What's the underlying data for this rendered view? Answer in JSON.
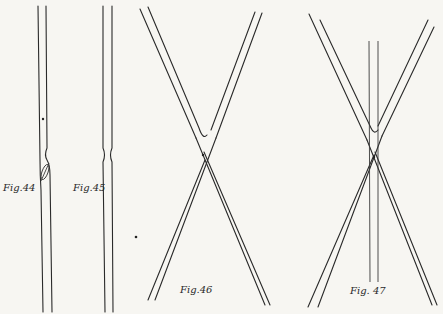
{
  "figures": [
    {
      "id": "fig44",
      "label": "Fig.44",
      "description": "single straight tube with a dot and an oblique oval inclusion near a constriction"
    },
    {
      "id": "fig45",
      "label": "Fig.45",
      "description": "single straight tube with a small constriction"
    },
    {
      "id": "fig46",
      "label": "Fig.46",
      "description": "two crossed tubes forming an X with a dot at the junction"
    },
    {
      "id": "fig47",
      "label": "Fig. 47",
      "description": "two crossed tubes forming an X with a vertical tube passing through the junction"
    }
  ],
  "colors": {
    "background": "#f7f6f2",
    "ink": "#2a2a2a"
  }
}
